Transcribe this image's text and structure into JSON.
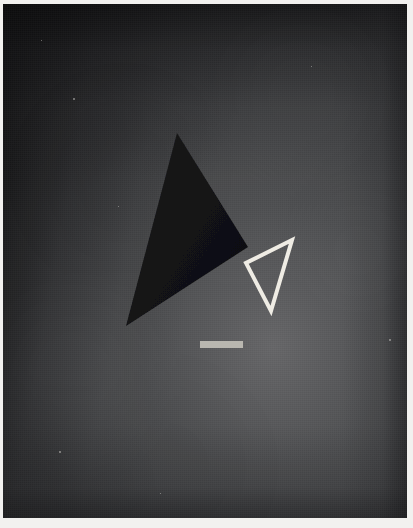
{
  "artwork": {
    "title": "Abstract Composition with Triangles",
    "medium_appearance": "painted canvas photograph",
    "orientation": "portrait",
    "dimensions": {
      "width": 413,
      "height": 528
    }
  },
  "canvas": {
    "frame": {
      "x": 3,
      "y": 4,
      "width": 404,
      "height": 514
    },
    "paper_margin_color": "#f2f1ef",
    "background": {
      "base_color": "#3f4042",
      "light_color": "#68686a",
      "dark_corner_color": "#0c0c0d",
      "gradient_note": "dark at top-left corner, brightening toward lower-right of centre"
    }
  },
  "shapes": [
    {
      "id": "dark-triangle",
      "name": "large-dark-triangle",
      "type": "triangle",
      "fill": "#141416",
      "stroke": "none",
      "points": "177,133 248,247 126,326",
      "vertices": [
        {
          "label": "apex",
          "x": 177,
          "y": 133
        },
        {
          "label": "right",
          "x": 248,
          "y": 247
        },
        {
          "label": "bottom-left",
          "x": 126,
          "y": 326
        }
      ]
    },
    {
      "id": "white-triangle",
      "name": "small-white-outline-triangle",
      "type": "triangle",
      "fill": "none",
      "stroke": "#efece4",
      "stroke_width": 4,
      "points": "292,240 246,263 271,311",
      "vertices": [
        {
          "label": "top-right",
          "x": 292,
          "y": 240
        },
        {
          "label": "left",
          "x": 246,
          "y": 263
        },
        {
          "label": "bottom",
          "x": 271,
          "y": 311
        }
      ]
    },
    {
      "id": "light-bar",
      "name": "horizontal-light-bar",
      "type": "rectangle",
      "fill": "#b9b7b0",
      "x": 200,
      "y": 341,
      "width": 43,
      "height": 7
    }
  ],
  "specks": [
    {
      "x": 73,
      "y": 98,
      "size": 2
    },
    {
      "x": 41,
      "y": 40,
      "size": 1
    },
    {
      "x": 59,
      "y": 451,
      "size": 2
    },
    {
      "x": 118,
      "y": 206,
      "size": 1
    },
    {
      "x": 311,
      "y": 66,
      "size": 1
    },
    {
      "x": 389,
      "y": 339,
      "size": 2
    },
    {
      "x": 160,
      "y": 493,
      "size": 1
    }
  ]
}
